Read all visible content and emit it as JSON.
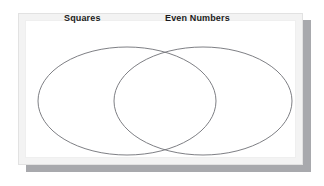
{
  "diagram": {
    "kind": "venn-diagram",
    "set_count": 2,
    "panel": {
      "background_color": "#ffffff",
      "frame_color": "#f3f3f3",
      "shadow_color": "#a8a9ad"
    },
    "stroke_color": "#6f7076",
    "label_color": "#1b1b20",
    "sets": [
      {
        "id": "squares",
        "label": "Squares",
        "side": "left",
        "center_x": 127,
        "center_y": 101,
        "radius_x": 89,
        "radius_y": 54,
        "fill": "none"
      },
      {
        "id": "even-numbers",
        "label": "Even Numbers",
        "side": "right",
        "center_x": 203,
        "center_y": 101,
        "radius_x": 89,
        "radius_y": 54,
        "fill": "none"
      }
    ],
    "regions": [
      {
        "id": "squares-only",
        "label": "",
        "contents": []
      },
      {
        "id": "intersection",
        "label": "",
        "contents": []
      },
      {
        "id": "even-numbers-only",
        "label": "",
        "contents": []
      }
    ]
  }
}
